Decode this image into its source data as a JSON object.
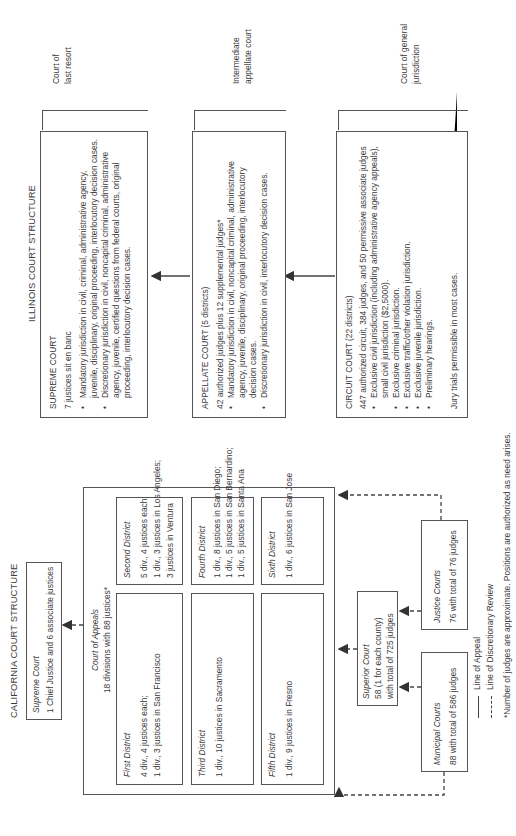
{
  "california": {
    "title": "CALIFORNIA COURT STRUCTURE",
    "supreme": {
      "name": "Supreme Court",
      "detail": "1 Chief Justice and 6 associate justices"
    },
    "court_of_appeals": {
      "name": "Court of Appeals",
      "detail": "18 divisions with 88 justices*",
      "districts": [
        {
          "name": "First District",
          "lines": [
            "4 div., 4 justices each;",
            "1 div., 3 justices in San Francisco"
          ]
        },
        {
          "name": "Second District",
          "lines": [
            "5 div., 4 justices each;",
            "1 div., 3 justices in Los Angeles;",
            "3 justices in Ventura"
          ]
        },
        {
          "name": "Third District",
          "lines": [
            "1 div., 10 justices in Sacramento"
          ]
        },
        {
          "name": "Fourth District",
          "lines": [
            "1 div., 8 justices in San Diego;",
            "1 div., 5 justices in San Bernardino;",
            "1 div., 5 justices in Santa Ana"
          ]
        },
        {
          "name": "Fifth District",
          "lines": [
            "1 div., 9 justices in Fresno"
          ]
        },
        {
          "name": "Sixth District",
          "lines": [
            "1 div., 6 justices in San Jose"
          ]
        }
      ]
    },
    "superior": {
      "name": "Superior Court",
      "lines": [
        "58 (1 for each county)",
        "with total of 725 judges"
      ]
    },
    "municipal": {
      "name": "Municipal Courts",
      "detail": "88 with total of 586 judges"
    },
    "justice": {
      "name": "Justice Courts",
      "detail": "76 with total of 76 judges"
    },
    "legend": {
      "appeal": "Line of Appeal",
      "discretionary": "Line of Discretionary Review"
    },
    "footnote": "*Number of judges are approximate. Positions are authorized as need arises."
  },
  "illinois": {
    "title": "ILLINOIS COURT STRUCTURE",
    "supreme": {
      "name": "SUPREME COURT",
      "detail": "7 justices sit en banc",
      "bullets": [
        [
          "Mandatory jurisdiction in civil, criminal, administrative agency,",
          "juvenile, disciplinary, original proceeding, interlocutory decision cases."
        ],
        [
          "Discretionary jurisdiction in civil, noncapital criminal, administrative",
          "agency, juvenile, certified questions from federal courts, original",
          "proceeding, interlocutory decision cases."
        ]
      ],
      "bracket_label": [
        "Court of",
        "last resort"
      ]
    },
    "appellate": {
      "name": "APPELLATE COURT (5 districts)",
      "detail": "42 authorized judges plus 12 supplemental judges*",
      "bullets": [
        [
          "Mandatory jurisdiction in civil, noncapital criminal, administrative",
          "agency, juvenile, disciplinary, original proceeding, interlocutory",
          "decision cases."
        ],
        [
          "Discretionary jurisdiction in civil, interlocutory decision cases."
        ]
      ],
      "bracket_label": [
        "Intermediate",
        "appellate court"
      ]
    },
    "circuit": {
      "name": "CIRCUIT COURT (22 districts)",
      "detail": "447 authorized circuit, 384 judges, and 50 permissive associate judges",
      "bullets": [
        [
          "Exclusive civil jurisdiction (including administrative agency appeals),",
          "small civil jurisdiction ($2,5000)."
        ],
        [
          "Exclusive criminal jurisdiction."
        ],
        [
          "Exclusive traffic/other violation jurisdiction."
        ],
        [
          "Exclusive juvenile jurisdiction."
        ],
        [
          "Preliminary hearings."
        ]
      ],
      "note": "Jury trials permissible in most cases.",
      "bracket_label": [
        "Court of general",
        "jurisdiction"
      ]
    }
  },
  "colors": {
    "line": "#444444",
    "text": "#3a3a3a",
    "background": "#ffffff"
  }
}
